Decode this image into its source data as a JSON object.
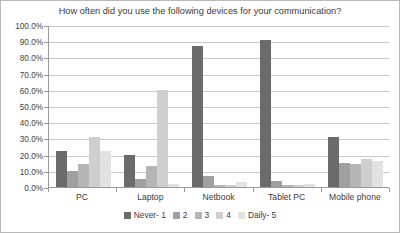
{
  "chart_data": {
    "type": "bar",
    "title": "How often did you use the following devices for your communication?",
    "xlabel": "",
    "ylabel": "",
    "ylim": [
      0,
      100
    ],
    "ytick_labels": [
      "100.0%",
      "90.0%",
      "80.0%",
      "70.0%",
      "60.0%",
      "50.0%",
      "40.0%",
      "30.0%",
      "20.0%",
      "10.0%",
      "0.0%"
    ],
    "ytick_values": [
      100,
      90,
      80,
      70,
      60,
      50,
      40,
      30,
      20,
      10,
      0
    ],
    "grid": true,
    "legend_position": "bottom",
    "categories": [
      "PC",
      "Laptop",
      "Netbook",
      "Tablet PC",
      "Mobile phone"
    ],
    "series": [
      {
        "name": "Never- 1",
        "color": "#6b6b6b",
        "values": [
          22,
          20,
          87,
          91,
          31
        ]
      },
      {
        "name": "2",
        "color": "#a0a0a0",
        "values": [
          10,
          5,
          7,
          4,
          15
        ]
      },
      {
        "name": "3",
        "color": "#b5b5b5",
        "values": [
          14,
          13,
          1,
          1,
          14
        ]
      },
      {
        "name": "4",
        "color": "#cfcfcf",
        "values": [
          31,
          60,
          1,
          1,
          17
        ]
      },
      {
        "name": "Daily- 5",
        "color": "#e2e2e2",
        "values": [
          22,
          2,
          3,
          2,
          16
        ]
      }
    ]
  },
  "colors": {
    "axis": "#9a9a9a",
    "gridline": "#c8c8c8",
    "text": "#3c3c3c",
    "border": "#b9b9b9",
    "background": "#ffffff"
  }
}
